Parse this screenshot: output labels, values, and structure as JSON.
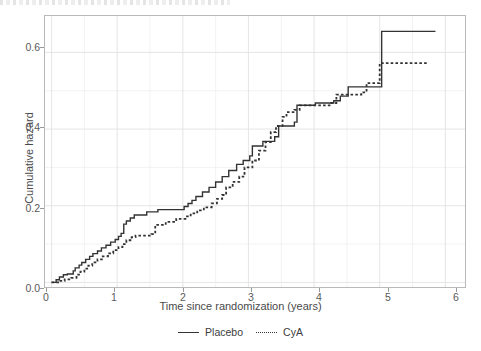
{
  "chart_data": {
    "type": "line",
    "subtype": "step",
    "title": "",
    "xlabel": "Time since randomization (years)",
    "ylabel": "Cumulative hazard",
    "xlim": [
      -0.1,
      6.3
    ],
    "ylim": [
      -0.012,
      0.695
    ],
    "xticks": [
      0,
      1,
      2,
      3,
      4,
      5,
      6
    ],
    "xtick_labels": [
      "0",
      "1",
      "2",
      "3",
      "4",
      "5",
      "6"
    ],
    "yticks": [
      0.0,
      0.2,
      0.4,
      0.6
    ],
    "ytick_labels": [
      "0.0",
      "0.2",
      "0.4",
      "0.6"
    ],
    "grid": true,
    "grid_minor": true,
    "legend_position": "bottom",
    "series": [
      {
        "name": "Placebo",
        "style": "solid",
        "color": "#333333",
        "points": [
          [
            0.0,
            0.0
          ],
          [
            0.07,
            0.007
          ],
          [
            0.12,
            0.014
          ],
          [
            0.18,
            0.02
          ],
          [
            0.24,
            0.022
          ],
          [
            0.33,
            0.03
          ],
          [
            0.36,
            0.038
          ],
          [
            0.42,
            0.045
          ],
          [
            0.46,
            0.052
          ],
          [
            0.52,
            0.06
          ],
          [
            0.58,
            0.068
          ],
          [
            0.63,
            0.075
          ],
          [
            0.7,
            0.082
          ],
          [
            0.76,
            0.09
          ],
          [
            0.83,
            0.097
          ],
          [
            0.9,
            0.105
          ],
          [
            0.97,
            0.112
          ],
          [
            1.02,
            0.12
          ],
          [
            1.06,
            0.128
          ],
          [
            1.1,
            0.152
          ],
          [
            1.14,
            0.16
          ],
          [
            1.2,
            0.168
          ],
          [
            1.26,
            0.176
          ],
          [
            1.45,
            0.184
          ],
          [
            1.62,
            0.19
          ],
          [
            2.02,
            0.198
          ],
          [
            2.08,
            0.206
          ],
          [
            2.14,
            0.214
          ],
          [
            2.2,
            0.224
          ],
          [
            2.3,
            0.236
          ],
          [
            2.4,
            0.248
          ],
          [
            2.5,
            0.262
          ],
          [
            2.6,
            0.276
          ],
          [
            2.7,
            0.292
          ],
          [
            2.82,
            0.308
          ],
          [
            2.92,
            0.318
          ],
          [
            3.02,
            0.33
          ],
          [
            3.06,
            0.356
          ],
          [
            3.22,
            0.368
          ],
          [
            3.4,
            0.38
          ],
          [
            3.46,
            0.408
          ],
          [
            3.7,
            0.418
          ],
          [
            3.74,
            0.462
          ],
          [
            4.02,
            0.468
          ],
          [
            4.3,
            0.474
          ],
          [
            4.4,
            0.486
          ],
          [
            4.52,
            0.51
          ],
          [
            5.03,
            0.51
          ],
          [
            5.03,
            0.655
          ],
          [
            5.85,
            0.655
          ]
        ]
      },
      {
        "name": "CyA",
        "style": "dotted",
        "color": "#333333",
        "points": [
          [
            0.0,
            0.0
          ],
          [
            0.1,
            0.004
          ],
          [
            0.2,
            0.008
          ],
          [
            0.3,
            0.012
          ],
          [
            0.38,
            0.02
          ],
          [
            0.44,
            0.028
          ],
          [
            0.5,
            0.036
          ],
          [
            0.56,
            0.044
          ],
          [
            0.62,
            0.052
          ],
          [
            0.7,
            0.06
          ],
          [
            0.78,
            0.068
          ],
          [
            0.86,
            0.076
          ],
          [
            0.94,
            0.084
          ],
          [
            1.02,
            0.092
          ],
          [
            1.08,
            0.1
          ],
          [
            1.14,
            0.11
          ],
          [
            1.22,
            0.118
          ],
          [
            1.28,
            0.122
          ],
          [
            1.52,
            0.126
          ],
          [
            1.58,
            0.15
          ],
          [
            1.74,
            0.158
          ],
          [
            1.9,
            0.166
          ],
          [
            2.04,
            0.172
          ],
          [
            2.12,
            0.18
          ],
          [
            2.22,
            0.188
          ],
          [
            2.32,
            0.196
          ],
          [
            2.44,
            0.206
          ],
          [
            2.52,
            0.218
          ],
          [
            2.6,
            0.228
          ],
          [
            2.66,
            0.248
          ],
          [
            2.76,
            0.262
          ],
          [
            2.86,
            0.276
          ],
          [
            2.94,
            0.3
          ],
          [
            3.06,
            0.318
          ],
          [
            3.16,
            0.344
          ],
          [
            3.26,
            0.366
          ],
          [
            3.34,
            0.392
          ],
          [
            3.42,
            0.408
          ],
          [
            3.52,
            0.432
          ],
          [
            3.58,
            0.444
          ],
          [
            3.7,
            0.45
          ],
          [
            3.78,
            0.462
          ],
          [
            4.26,
            0.468
          ],
          [
            4.34,
            0.49
          ],
          [
            4.72,
            0.496
          ],
          [
            4.8,
            0.52
          ],
          [
            5.0,
            0.52
          ],
          [
            5.0,
            0.572
          ],
          [
            5.73,
            0.572
          ]
        ]
      }
    ],
    "annotations": []
  },
  "legend": {
    "entries": [
      {
        "label": "Placebo",
        "key": "solid-line-key"
      },
      {
        "label": "CyA",
        "key": "dotted-line-key"
      }
    ]
  }
}
